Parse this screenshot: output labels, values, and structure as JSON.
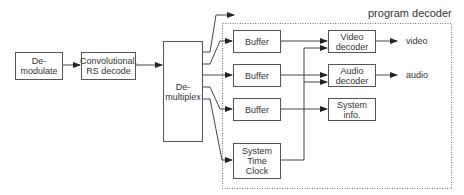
{
  "diagram": {
    "title": "program decoder",
    "blocks": {
      "demodulate": "De-\nmodulate",
      "fec": "Convolutional,\nRS decode",
      "demux": "De-\nmultiplex",
      "buffer1": "Buffer",
      "buffer2": "Buffer",
      "buffer3": "Buffer",
      "stc": "System\nTime\nClock",
      "video_decoder": "Video\ndecoder",
      "audio_decoder": "Audio\ndecoder",
      "system_info": "System\ninfo."
    },
    "outputs": {
      "video": "video",
      "audio": "audio"
    },
    "edges": [
      [
        "demodulate",
        "fec"
      ],
      [
        "fec",
        "demux"
      ],
      [
        "demux",
        "external-output"
      ],
      [
        "demux",
        "buffer1"
      ],
      [
        "demux",
        "buffer2"
      ],
      [
        "demux",
        "buffer3"
      ],
      [
        "demux",
        "stc"
      ],
      [
        "buffer1",
        "video_decoder"
      ],
      [
        "buffer2",
        "audio_decoder"
      ],
      [
        "buffer3",
        "system_info"
      ],
      [
        "stc",
        "video_decoder"
      ],
      [
        "stc",
        "audio_decoder"
      ],
      [
        "video_decoder",
        "video"
      ],
      [
        "audio_decoder",
        "audio"
      ]
    ]
  }
}
